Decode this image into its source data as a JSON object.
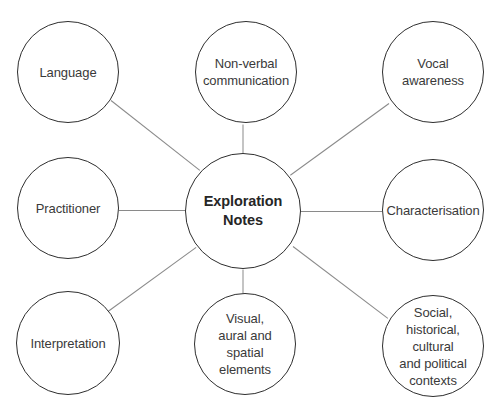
{
  "diagram": {
    "type": "mind-map",
    "colors": {
      "circle_stroke": "#2e2e2e",
      "connector": "#8a8a8a",
      "text": "#3a3a3a",
      "background": "#ffffff"
    },
    "center": {
      "id": "center",
      "label": "Exploration\nNotes",
      "cx": 243,
      "cy": 211,
      "r": 58
    },
    "nodes": [
      {
        "id": "language",
        "label": "Language",
        "cx": 68,
        "cy": 72,
        "r": 51,
        "line": [
          111,
          100,
          200,
          170
        ]
      },
      {
        "id": "non-verbal",
        "label": "Non-verbal\ncommunication",
        "cx": 246,
        "cy": 72,
        "r": 51,
        "line": [
          243,
          124,
          243,
          153
        ]
      },
      {
        "id": "vocal",
        "label": "Vocal\nawareness",
        "cx": 433,
        "cy": 72,
        "r": 51,
        "line": [
          389,
          103,
          290,
          175
        ]
      },
      {
        "id": "practitioner",
        "label": "Practitioner",
        "cx": 68,
        "cy": 208,
        "r": 51,
        "line": [
          119,
          210,
          185,
          210
        ]
      },
      {
        "id": "characterisation",
        "label": "Characterisation",
        "cx": 433,
        "cy": 210,
        "r": 51,
        "line": [
          301,
          211,
          382,
          211
        ]
      },
      {
        "id": "interpretation",
        "label": "Interpretation",
        "cx": 68,
        "cy": 343,
        "r": 52,
        "line": [
          108,
          311,
          196,
          247
        ]
      },
      {
        "id": "visual",
        "label": "Visual,\naural and\nspatial\nelements",
        "cx": 245,
        "cy": 344,
        "r": 51,
        "line": [
          243,
          269,
          243,
          293
        ]
      },
      {
        "id": "social",
        "label": "Social,\nhistorical,\ncultural\nand political\ncontexts",
        "cx": 433,
        "cy": 346,
        "r": 51,
        "line": [
          293,
          246,
          388,
          318
        ]
      }
    ]
  }
}
